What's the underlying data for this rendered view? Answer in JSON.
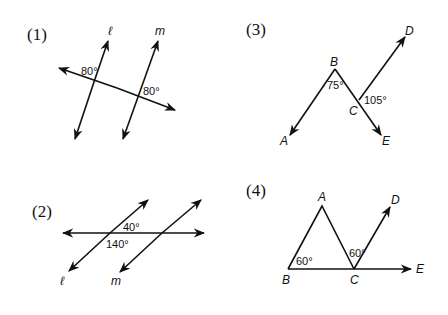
{
  "diagrams": [
    {
      "id": "1",
      "label": "(1)",
      "type": "parallel-lines-transversal",
      "line_labels": [
        "ℓ",
        "m"
      ],
      "angles": [
        "80°",
        "80°"
      ]
    },
    {
      "id": "2",
      "label": "(2)",
      "type": "parallel-lines-transversal",
      "line_labels": [
        "ℓ",
        "m"
      ],
      "angles": [
        "40°",
        "140°"
      ]
    },
    {
      "id": "3",
      "label": "(3)",
      "type": "rays",
      "points": [
        "A",
        "B",
        "C",
        "D",
        "E"
      ],
      "angles": [
        "75°",
        "105°"
      ]
    },
    {
      "id": "4",
      "label": "(4)",
      "type": "triangle-with-ray",
      "points": [
        "A",
        "B",
        "C",
        "D",
        "E"
      ],
      "angles": [
        "60°",
        "60°"
      ]
    }
  ]
}
